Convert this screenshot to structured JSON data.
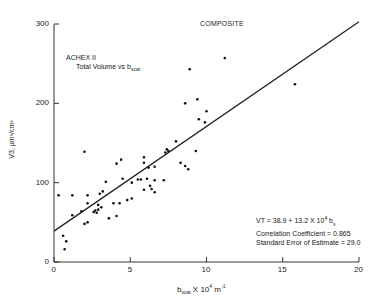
{
  "chart_data": {
    "type": "scatter",
    "title": "COMPOSITE",
    "subtitle": "ACHEX II",
    "subtitle2_prefix": "Total Volume vs b",
    "subtitle2_sub": "scat",
    "xlabel_prefix": "b",
    "xlabel_sub": "scat",
    "xlabel_suffix": " X 10",
    "xlabel_exp": "4",
    "xlabel_unit": " m",
    "xlabel_unit_exp": "-1",
    "ylabel": "V3, µm³/cm³",
    "xlim": [
      0,
      20
    ],
    "ylim": [
      0,
      300
    ],
    "xticks": [
      0,
      5,
      10,
      15,
      20
    ],
    "yticks": [
      0,
      100,
      200,
      300
    ],
    "grid": false,
    "fit_line": {
      "intercept": 38.9,
      "slope": 13.2
    },
    "annotation": {
      "line1_prefix": "VT = 38.9 + 13.2 X 10",
      "line1_exp": "4",
      "line1_suffix": " b",
      "line1_sub": "s",
      "line2": "Correlation Coefficient = 0.865",
      "line3": "Standard Error of Estimate = 29.0"
    },
    "points": [
      [
        0.3,
        84
      ],
      [
        0.6,
        33
      ],
      [
        0.8,
        26
      ],
      [
        0.7,
        16
      ],
      [
        1.2,
        84
      ],
      [
        1.2,
        59
      ],
      [
        1.8,
        64
      ],
      [
        2.0,
        48
      ],
      [
        2.2,
        50
      ],
      [
        2.2,
        84
      ],
      [
        2.2,
        74
      ],
      [
        2.0,
        139
      ],
      [
        2.6,
        63
      ],
      [
        2.8,
        62
      ],
      [
        2.9,
        66
      ],
      [
        2.9,
        72
      ],
      [
        3.0,
        86
      ],
      [
        3.2,
        89
      ],
      [
        3.1,
        69
      ],
      [
        3.6,
        55
      ],
      [
        3.9,
        74
      ],
      [
        4.1,
        58
      ],
      [
        4.3,
        74
      ],
      [
        4.1,
        124
      ],
      [
        4.4,
        129
      ],
      [
        4.5,
        105
      ],
      [
        4.8,
        78
      ],
      [
        5.1,
        80
      ],
      [
        5.1,
        100
      ],
      [
        5.5,
        104
      ],
      [
        5.9,
        91
      ],
      [
        5.9,
        132
      ],
      [
        5.9,
        125
      ],
      [
        6.2,
        119
      ],
      [
        6.1,
        105
      ],
      [
        6.4,
        92
      ],
      [
        6.6,
        88
      ],
      [
        6.6,
        120
      ],
      [
        6.6,
        103
      ],
      [
        7.2,
        103
      ],
      [
        7.3,
        138
      ],
      [
        7.5,
        140
      ],
      [
        7.4,
        142
      ],
      [
        8.0,
        152
      ],
      [
        8.3,
        125
      ],
      [
        8.6,
        121
      ],
      [
        8.8,
        117
      ],
      [
        8.6,
        200
      ],
      [
        8.9,
        243
      ],
      [
        9.3,
        140
      ],
      [
        9.5,
        180
      ],
      [
        9.4,
        205
      ],
      [
        9.9,
        176
      ],
      [
        10.0,
        190
      ],
      [
        11.2,
        257
      ],
      [
        15.8,
        224
      ],
      [
        6.3,
        96
      ],
      [
        5.7,
        104
      ],
      [
        3.4,
        101
      ],
      [
        2.7,
        65
      ]
    ]
  }
}
